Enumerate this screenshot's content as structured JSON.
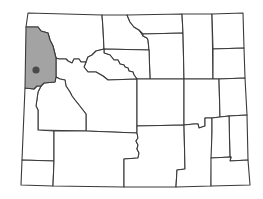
{
  "map": {
    "subject": "Wyoming counties locator map",
    "highlighted_county": "Teton County",
    "colors": {
      "background": "#ffffff",
      "county_fill": "#ffffff",
      "highlight_fill": "#a3a3a3",
      "border": "#3a3a3a",
      "marker": "#4a4a4a"
    },
    "marker": {
      "cx": 36,
      "cy": 70,
      "r": 3.6
    },
    "counties": [
      {
        "id": "teton",
        "highlight": true,
        "d": "M26,27 L38,27 L41,31 L48,33 L50,40 L53,46 L56,58 L56,77 L55,82 L44,83 L41,86 L37,86 L34,89 L25,88 Z"
      },
      {
        "id": "park",
        "highlight": false,
        "d": "M28,13 L102,15 L103,28 L104,49 L96,51 L92,55 L88,57 L86,62 L81,62 L79,59 L74,59 L72,63 L68,61 L66,59 L59,59 L56,58 L53,46 L50,40 L48,33 L41,31 L38,27 L26,27 Z"
      },
      {
        "id": "big-horn",
        "highlight": false,
        "d": "M102,15 L127,15 L130,22 L134,27 L139,30 L143,36 L147,38 L148,40 L149,50 L104,49 L103,28 Z"
      },
      {
        "id": "sheridan",
        "highlight": false,
        "d": "M127,15 L182,14 L183,33 L143,34 L139,30 L134,27 L130,22 Z"
      },
      {
        "id": "johnson",
        "highlight": false,
        "d": "M143,34 L183,33 L184,79 L150,79 L149,50 L148,40 L147,38 L143,36 Z"
      },
      {
        "id": "washakie",
        "highlight": false,
        "d": "M104,49 L149,50 L150,79 L137,79 L134,75 L133,72 L129,71 L128,68 L125,67 L124,65 L120,64 L118,60 L114,60 L110,55 L104,53 Z"
      },
      {
        "id": "hot-springs",
        "highlight": false,
        "d": "M86,62 L88,57 L92,55 L96,51 L104,49 L104,53 L110,55 L114,60 L118,60 L120,64 L124,65 L125,67 L128,68 L129,71 L133,72 L134,75 L137,79 L108,80 L103,76 L96,72 L88,72 L84,67 Z"
      },
      {
        "id": "campbell",
        "highlight": false,
        "d": "M182,14 L212,14 L213,79 L184,79 L183,33 Z"
      },
      {
        "id": "crook",
        "highlight": false,
        "d": "M212,14 L243,13 L244,48 L213,49 Z"
      },
      {
        "id": "weston",
        "highlight": false,
        "d": "M213,49 L244,48 L245,78 L219,79 L213,79 Z"
      },
      {
        "id": "fremont",
        "highlight": false,
        "d": "M56,77 L56,58 L59,59 L66,59 L68,61 L72,63 L74,59 L79,59 L81,62 L86,62 L84,67 L88,72 L96,72 L103,76 L108,80 L137,79 L137,133 L86,131 L86,114 L79,105 L75,100 L72,96 L70,92 L66,86 L65,80 L60,79 Z"
      },
      {
        "id": "sublette",
        "highlight": false,
        "d": "M41,86 L44,83 L55,82 L56,77 L60,79 L65,80 L66,86 L70,92 L72,96 L75,100 L79,105 L86,114 L86,131 L38,130 L38,121 L38,110 L36,106 L37,99 L38,92 Z"
      },
      {
        "id": "lincoln",
        "highlight": false,
        "d": "M25,88 L34,89 L37,86 L41,86 L38,92 L37,99 L36,106 L38,110 L38,121 L38,130 L54,131 L54,161 L22,160 Z"
      },
      {
        "id": "uinta",
        "highlight": false,
        "d": "M22,160 L54,161 L53,186 L21,185 Z"
      },
      {
        "id": "sweetwater",
        "highlight": false,
        "d": "M54,131 L86,131 L137,133 L138,138 L136,141 L138,145 L137,149 L139,153 L138,158 L124,159 L124,187 L53,186 L54,161 Z"
      },
      {
        "id": "natrona",
        "highlight": false,
        "d": "M137,79 L150,79 L184,79 L184,125 L137,126 Z"
      },
      {
        "id": "converse",
        "highlight": false,
        "d": "M184,79 L219,79 L220,117 L212,118 L205,118 L205,126 L199,128 L198,124 L194,124 L184,125 Z"
      },
      {
        "id": "niobrara",
        "highlight": false,
        "d": "M219,79 L245,78 L247,115 L229,116 L220,117 Z"
      },
      {
        "id": "carbon",
        "highlight": false,
        "d": "M137,126 L184,125 L185,169 L177,170 L176,187 L124,187 L124,159 L138,158 L139,153 L137,149 L138,145 L136,141 L138,138 L137,133 Z"
      },
      {
        "id": "albany",
        "highlight": false,
        "d": "M184,125 L194,124 L198,124 L199,128 L205,126 L205,118 L212,118 L212,133 L211,186 L176,187 L177,170 L185,169 Z"
      },
      {
        "id": "goshen",
        "highlight": false,
        "d": "M229,116 L247,115 L248,160 L230,161 Z"
      },
      {
        "id": "platte",
        "highlight": false,
        "d": "M212,118 L220,117 L229,116 L230,161 L231,157 L211,158 L212,133 Z"
      },
      {
        "id": "laramie",
        "highlight": false,
        "d": "M211,158 L231,157 L230,161 L248,160 L250,185 L211,186 Z"
      }
    ]
  }
}
